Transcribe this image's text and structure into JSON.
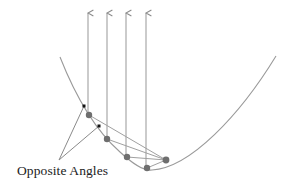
{
  "diagram": {
    "label": "Opposite Angles",
    "colors": {
      "curve": "#9a9a9a",
      "rays": "#a0a0a0",
      "points": "#6e6e6e",
      "markers": "#111111",
      "label_text": "#222222",
      "background": "#ffffff"
    },
    "parabola": {
      "start": [
        60,
        57
      ],
      "vertex": [
        150,
        170
      ],
      "end": [
        276,
        56
      ]
    },
    "focus": [
      166,
      160
    ],
    "rays": [
      {
        "x": 88,
        "top_y": 12,
        "hit_point": [
          89,
          115
        ]
      },
      {
        "x": 107,
        "top_y": 12,
        "hit_point": [
          107,
          139
        ]
      },
      {
        "x": 126,
        "top_y": 12,
        "hit_point": [
          127,
          157
        ]
      },
      {
        "x": 146,
        "top_y": 12,
        "hit_point": [
          147,
          168
        ]
      }
    ],
    "angle_markers": [
      [
        84,
        106
      ],
      [
        99,
        126
      ]
    ],
    "label_pointer_origin": [
      59,
      160
    ]
  }
}
